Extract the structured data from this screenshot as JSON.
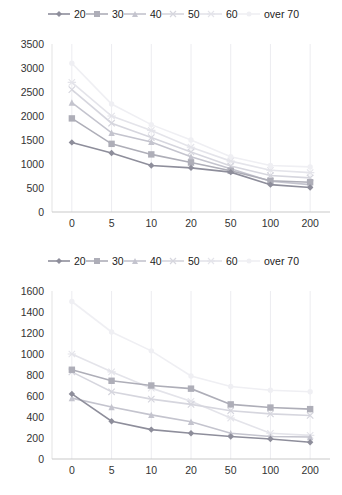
{
  "chart_data": [
    {
      "type": "line",
      "title": "",
      "xlabel": "",
      "ylabel": "",
      "legend_position": "top",
      "grid": "vertical-only",
      "categories": [
        "0",
        "5",
        "10",
        "20",
        "50",
        "100",
        "200"
      ],
      "ylim": [
        0,
        3500
      ],
      "ytick_step": 500,
      "series": [
        {
          "name": "20",
          "marker": "diamond",
          "color": "#8e8e9b",
          "values": [
            1450,
            1230,
            970,
            920,
            830,
            570,
            510
          ]
        },
        {
          "name": "30",
          "marker": "square",
          "color": "#aeaeb8",
          "values": [
            1950,
            1420,
            1200,
            1030,
            860,
            650,
            620
          ]
        },
        {
          "name": "40",
          "marker": "triangle",
          "color": "#c4c4ce",
          "values": [
            2280,
            1650,
            1460,
            1150,
            900,
            640,
            570
          ]
        },
        {
          "name": "50",
          "marker": "x",
          "color": "#d6d6de",
          "values": [
            2550,
            1850,
            1550,
            1250,
            960,
            760,
            710
          ]
        },
        {
          "name": "60",
          "marker": "asterisk",
          "color": "#e4e4ea",
          "values": [
            2700,
            2000,
            1700,
            1350,
            1060,
            870,
            820
          ]
        },
        {
          "name": "over 70",
          "marker": "circle",
          "color": "#efeff3",
          "values": [
            3100,
            2250,
            1820,
            1500,
            1150,
            970,
            940
          ]
        }
      ]
    },
    {
      "type": "line",
      "title": "",
      "xlabel": "",
      "ylabel": "",
      "legend_position": "top",
      "grid": "vertical-only",
      "categories": [
        "0",
        "5",
        "10",
        "20",
        "50",
        "100",
        "200"
      ],
      "ylim": [
        0,
        1600
      ],
      "ytick_step": 200,
      "series": [
        {
          "name": "20",
          "marker": "diamond",
          "color": "#8e8e9b",
          "values": [
            620,
            360,
            280,
            245,
            215,
            190,
            160
          ]
        },
        {
          "name": "30",
          "marker": "square",
          "color": "#aeaeb8",
          "values": [
            850,
            745,
            700,
            670,
            520,
            490,
            475
          ]
        },
        {
          "name": "40",
          "marker": "triangle",
          "color": "#c4c4ce",
          "values": [
            580,
            495,
            420,
            355,
            245,
            215,
            210
          ]
        },
        {
          "name": "50",
          "marker": "x",
          "color": "#d6d6de",
          "values": [
            830,
            640,
            570,
            520,
            460,
            430,
            415
          ]
        },
        {
          "name": "60",
          "marker": "asterisk",
          "color": "#e4e4ea",
          "values": [
            1000,
            830,
            675,
            550,
            390,
            245,
            225
          ]
        },
        {
          "name": "over 70",
          "marker": "circle",
          "color": "#efeff3",
          "values": [
            1500,
            1210,
            1030,
            790,
            690,
            655,
            640
          ]
        }
      ]
    }
  ],
  "style": {
    "background": "#ffffff",
    "grid_color": "#ececf0",
    "axis_color": "#c9c9c9",
    "tick_text_color": "#333333",
    "legend_text_color": "#222222"
  }
}
